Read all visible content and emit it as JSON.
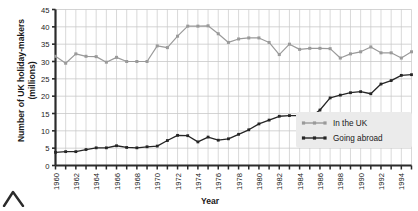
{
  "chart_data": {
    "type": "line",
    "title": "",
    "xlabel": "Year",
    "ylabel": "Number of UK holiday-makers (millions)",
    "ylim": [
      0,
      45
    ],
    "xlim": [
      1960,
      1995
    ],
    "grid": true,
    "legend_position": "bottom-right",
    "y_ticks": [
      0,
      5,
      10,
      15,
      20,
      25,
      30,
      35,
      40,
      45
    ],
    "x_ticks": [
      1960,
      1961,
      1962,
      1963,
      1964,
      1965,
      1966,
      1967,
      1968,
      1969,
      1970,
      1971,
      1972,
      1973,
      1974,
      1975,
      1976,
      1977,
      1978,
      1979,
      1980,
      1981,
      1982,
      1983,
      1984,
      1985,
      1986,
      1987,
      1988,
      1989,
      1990,
      1991,
      1992,
      1993,
      1994,
      1995
    ],
    "x_tick_labels": [
      "1960",
      "",
      "1962",
      "",
      "1964",
      "",
      "1966",
      "",
      "1968",
      "",
      "1970",
      "",
      "1972",
      "",
      "1974",
      "",
      "1976",
      "",
      "1978",
      "",
      "1980",
      "",
      "1982",
      "",
      "1984",
      "",
      "1986",
      "",
      "1988",
      "",
      "1990",
      "",
      "1992",
      "",
      "1994",
      ""
    ],
    "categories": [
      1960,
      1961,
      1962,
      1963,
      1964,
      1965,
      1966,
      1967,
      1968,
      1969,
      1970,
      1971,
      1972,
      1973,
      1974,
      1975,
      1976,
      1977,
      1978,
      1979,
      1980,
      1981,
      1982,
      1983,
      1984,
      1985,
      1986,
      1987,
      1988,
      1989,
      1990,
      1991,
      1992,
      1993,
      1994,
      1995
    ],
    "series": [
      {
        "name": "In the UK",
        "color": "#9a9a9a",
        "marker": "square",
        "values": [
          31.5,
          29.5,
          32.2,
          31.5,
          31.4,
          29.8,
          31.2,
          30.0,
          30.0,
          30.0,
          34.5,
          34.0,
          37.3,
          40.2,
          40.2,
          40.3,
          38.0,
          35.5,
          36.5,
          36.8,
          36.8,
          35.5,
          32.0,
          35.0,
          33.5,
          33.8,
          33.8,
          33.7,
          31.0,
          32.2,
          32.8,
          34.2,
          32.5,
          32.5,
          31.0,
          32.8
        ]
      },
      {
        "name": "Going abroad",
        "color": "#262626",
        "marker": "square",
        "values": [
          3.8,
          4.0,
          4.0,
          4.6,
          5.1,
          5.1,
          5.7,
          5.2,
          5.1,
          5.4,
          5.6,
          7.2,
          8.7,
          8.6,
          6.8,
          8.2,
          7.3,
          7.7,
          9.0,
          10.3,
          12.0,
          13.1,
          14.2,
          14.4,
          14.4,
          13.8,
          16.0,
          19.5,
          20.3,
          21.0,
          21.3,
          20.7,
          23.5,
          24.5,
          26.0,
          26.2
        ]
      }
    ]
  },
  "legend": {
    "items": [
      {
        "label": "In the UK",
        "color": "#9a9a9a"
      },
      {
        "label": "Going abroad",
        "color": "#262626"
      }
    ]
  },
  "axes": {
    "y_title": "Number of UK holiday-makers (millions)",
    "y_title_line1": "Number of UK holiday-makers",
    "y_title_line2": "(millions)",
    "x_title": "Year"
  }
}
